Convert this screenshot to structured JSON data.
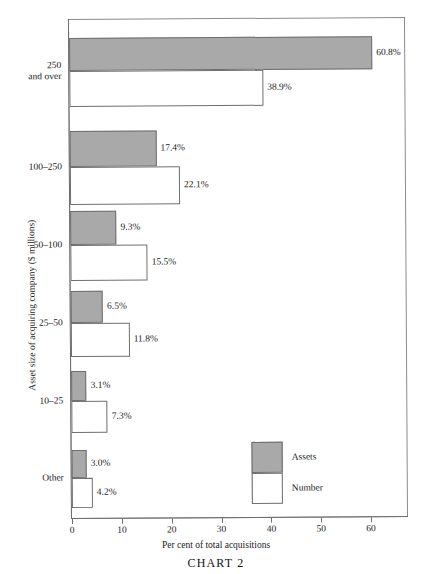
{
  "chart_data": {
    "type": "bar",
    "orientation": "horizontal",
    "title": "CHART 2",
    "xlabel": "Per cent of total acquisitions",
    "ylabel": "Asset size of acquiring company ($ millions)",
    "categories": [
      "250\nand over",
      "100–250",
      "50–100",
      "25–50",
      "10–25",
      "Other"
    ],
    "series": [
      {
        "name": "Assets",
        "values": [
          60.8,
          17.4,
          9.3,
          6.5,
          3.1,
          3.0
        ],
        "labels": [
          "60.8%",
          "17.4%",
          "9.3%",
          "6.5%",
          "3.1%",
          "3.0%"
        ],
        "color": "#a9a9a9"
      },
      {
        "name": "Number",
        "values": [
          38.9,
          22.1,
          15.5,
          11.8,
          7.3,
          4.2
        ],
        "labels": [
          "38.9%",
          "22.1%",
          "15.5%",
          "11.8%",
          "7.3%",
          "4.2%"
        ],
        "color": "#ffffff"
      }
    ],
    "xlim": [
      0,
      69
    ],
    "xticks": [
      0,
      10,
      20,
      30,
      40,
      50,
      60
    ],
    "xtick_labels": [
      "0",
      "10",
      "20",
      "30",
      "40",
      "50",
      "60"
    ],
    "grid": false,
    "legend_position": "inside-bottom-right",
    "legend_entries": [
      "Assets",
      "Number"
    ]
  },
  "axis": {
    "ticks": [
      {
        "value": 0,
        "label": "0"
      },
      {
        "value": 10,
        "label": "10"
      },
      {
        "value": 20,
        "label": "20"
      },
      {
        "value": 30,
        "label": "30"
      },
      {
        "value": 40,
        "label": "40"
      },
      {
        "value": 50,
        "label": "50"
      },
      {
        "value": 60,
        "label": "60"
      }
    ]
  },
  "categories": [
    {
      "label": "250\nand over",
      "assets": "60.8%",
      "number": "38.9%"
    },
    {
      "label": "100–250",
      "assets": "17.4%",
      "number": "22.1%"
    },
    {
      "label": "50–100",
      "assets": "9.3%",
      "number": "15.5%"
    },
    {
      "label": "25–50",
      "assets": "6.5%",
      "number": "11.8%"
    },
    {
      "label": "10–25",
      "assets": "3.1%",
      "number": "7.3%"
    },
    {
      "label": "Other",
      "assets": "3.0%",
      "number": "4.2%"
    }
  ],
  "legend": {
    "assets_label": "Assets",
    "number_label": "Number"
  },
  "labels": {
    "x_axis_title": "Per cent of total acquisitions",
    "y_axis_title": "Asset size of acquiring company ($ millions)",
    "chart_title": "CHART 2"
  },
  "colors": {
    "assets_fill": "#a9a9a9",
    "number_fill": "#ffffff",
    "outline": "#6f6f6f",
    "frame": "#8c8c8c",
    "text": "#222222"
  }
}
